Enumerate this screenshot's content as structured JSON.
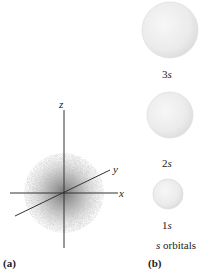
{
  "panel_a": {
    "label": "(a)",
    "axes": {
      "z": "z",
      "y": "y",
      "x": "x"
    }
  },
  "panel_b": {
    "label": "(b)",
    "caption_italic": "s",
    "caption_rest": " orbitals",
    "orbitals": [
      {
        "n": "3",
        "l": "s"
      },
      {
        "n": "2",
        "l": "s"
      },
      {
        "n": "1",
        "l": "s"
      }
    ]
  },
  "colors": {
    "axis": "#333333",
    "cloud": "#7a7a7a",
    "sphere_edge": "#cfcfcf",
    "sphere_fill": "#ececec"
  }
}
